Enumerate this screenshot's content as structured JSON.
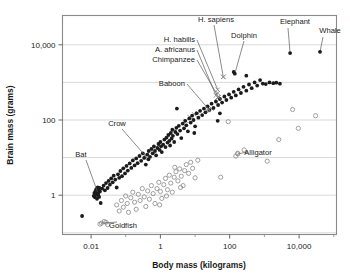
{
  "chart_data": {
    "type": "scatter",
    "title": "",
    "xlabel": "Body mass (kilograms)",
    "ylabel": "Brain mass (grams)",
    "xscale": "log",
    "yscale": "log",
    "xlim": [
      0.0015,
      120000
    ],
    "ylim": [
      0.09,
      60000
    ],
    "grid": true,
    "legend": "none",
    "xticks_labeled": [
      "0.01",
      "1",
      "100",
      "10,000"
    ],
    "xticks_values": [
      0.01,
      1,
      100,
      10000
    ],
    "xticks_minor_values": [
      0.1,
      10,
      1000,
      100000
    ],
    "yticks_labeled": [
      "1",
      "100",
      "10,000"
    ],
    "yticks_values": [
      1,
      100,
      10000
    ],
    "ygrid_values": [
      0.1,
      1,
      10,
      100,
      1000,
      10000
    ],
    "series": [
      {
        "name": "mammals-and-birds",
        "marker": "filled-circle",
        "color": "#1b1b1b",
        "points": [
          [
            0.0055,
            0.28
          ],
          [
            0.012,
            0.95
          ],
          [
            0.0125,
            1.15
          ],
          [
            0.013,
            0.88
          ],
          [
            0.0135,
            1.3
          ],
          [
            0.014,
            1.05
          ],
          [
            0.0142,
            1.45
          ],
          [
            0.0148,
            0.8
          ],
          [
            0.015,
            1.2
          ],
          [
            0.0155,
            1.6
          ],
          [
            0.016,
            1.0
          ],
          [
            0.0165,
            1.35
          ],
          [
            0.017,
            0.9
          ],
          [
            0.0175,
            1.55
          ],
          [
            0.018,
            1.25
          ],
          [
            0.019,
            0.62
          ],
          [
            0.021,
            1.5
          ],
          [
            0.023,
            1.8
          ],
          [
            0.025,
            1.35
          ],
          [
            0.027,
            2.1
          ],
          [
            0.03,
            1.55
          ],
          [
            0.032,
            2.4
          ],
          [
            0.035,
            1.9
          ],
          [
            0.038,
            2.8
          ],
          [
            0.042,
            2.2
          ],
          [
            0.045,
            3.3
          ],
          [
            0.05,
            2.6
          ],
          [
            0.055,
            1.6
          ],
          [
            0.06,
            3.6
          ],
          [
            0.065,
            2.9
          ],
          [
            0.07,
            4.4
          ],
          [
            0.078,
            3.2
          ],
          [
            0.085,
            5.2
          ],
          [
            0.095,
            3.8
          ],
          [
            0.105,
            6.0
          ],
          [
            0.115,
            4.5
          ],
          [
            0.13,
            7.0
          ],
          [
            0.145,
            5.3
          ],
          [
            0.16,
            8.4
          ],
          [
            0.18,
            6.2
          ],
          [
            0.2,
            9.5
          ],
          [
            0.22,
            7.1
          ],
          [
            0.25,
            11.0
          ],
          [
            0.28,
            8.2
          ],
          [
            0.31,
            13.0
          ],
          [
            0.34,
            9.8
          ],
          [
            0.38,
            6.5
          ],
          [
            0.42,
            12.0
          ],
          [
            0.46,
            15.0
          ],
          [
            0.5,
            10.5
          ],
          [
            0.55,
            17.0
          ],
          [
            0.6,
            13.0
          ],
          [
            0.65,
            20.0
          ],
          [
            0.7,
            15.0
          ],
          [
            0.75,
            11.5
          ],
          [
            0.82,
            18.0
          ],
          [
            0.88,
            23.0
          ],
          [
            0.95,
            16.0
          ],
          [
            1.0,
            26.0
          ],
          [
            1.05,
            20.0
          ],
          [
            1.1,
            14.0
          ],
          [
            1.2,
            22.0
          ],
          [
            1.3,
            30.0
          ],
          [
            1.4,
            19.0
          ],
          [
            1.5,
            34.0
          ],
          [
            1.6,
            25.0
          ],
          [
            1.7,
            40.0
          ],
          [
            1.8,
            28.0
          ],
          [
            1.9,
            21.0
          ],
          [
            2.0,
            45.0
          ],
          [
            2.1,
            32.0
          ],
          [
            2.2,
            55.0
          ],
          [
            2.3,
            38.0
          ],
          [
            2.5,
            26.0
          ],
          [
            2.7,
            48.0
          ],
          [
            2.9,
            62.0
          ],
          [
            3.1,
            42.0
          ],
          [
            3.4,
            70.0
          ],
          [
            3.7,
            52.0
          ],
          [
            4.0,
            33.0
          ],
          [
            4.4,
            80.0
          ],
          [
            4.8,
            60.0
          ],
          [
            5.2,
            95.0
          ],
          [
            5.6,
            72.0
          ],
          [
            6.2,
            50.0
          ],
          [
            6.8,
            110.0
          ],
          [
            7.5,
            85.0
          ],
          [
            8.2,
            130.0
          ],
          [
            9.0,
            100.0
          ],
          [
            10.0,
            68.0
          ],
          [
            11.0,
            150.0
          ],
          [
            12.5,
            115.0
          ],
          [
            14.0,
            175.0
          ],
          [
            16.0,
            135.0
          ],
          [
            18.0,
            200.0
          ],
          [
            20.0,
            160.0
          ],
          [
            23.0,
            230.0
          ],
          [
            26.0,
            185.0
          ],
          [
            30.0,
            270.0
          ],
          [
            34.0,
            210.0
          ],
          [
            40.0,
            310.0
          ],
          [
            46.0,
            250.0
          ],
          [
            52.0,
            360.0
          ],
          [
            60.0,
            290.0
          ],
          [
            70.0,
            420.0
          ],
          [
            80.0,
            340.0
          ],
          [
            95.0,
            480.0
          ],
          [
            110.0,
            390.0
          ],
          [
            130.0,
            560.0
          ],
          [
            150.0,
            450.0
          ],
          [
            180.0,
            650.0
          ],
          [
            210.0,
            520.0
          ],
          [
            250.0,
            760.0
          ],
          [
            300.0,
            600.0
          ],
          [
            360.0,
            880.0
          ],
          [
            430.0,
            700.0
          ],
          [
            520.0,
            1000.0
          ],
          [
            620.0,
            820.0
          ],
          [
            750.0,
            1150.0
          ],
          [
            900.0,
            930.0
          ],
          [
            1100.0,
            900.0
          ],
          [
            1400.0,
            1000.0
          ],
          [
            1800.0,
            950.0
          ],
          [
            2200.0,
            980.0
          ],
          [
            2800.0,
            920.0
          ],
          [
            130.0,
            1900.0
          ],
          [
            300.0,
            1500.0
          ],
          [
            45.0,
            95.0
          ],
          [
            52.0,
            150.0
          ],
          [
            9.5,
            45.0
          ],
          [
            3.0,
            200.0
          ]
        ]
      },
      {
        "name": "fish-reptiles-amphibians",
        "marker": "open-circle",
        "color": "#8f8f8f",
        "points": [
          [
            0.018,
            0.17
          ],
          [
            0.024,
            0.2
          ],
          [
            0.027,
            0.19
          ],
          [
            0.03,
            0.165
          ],
          [
            0.055,
            0.55
          ],
          [
            0.065,
            0.38
          ],
          [
            0.075,
            0.72
          ],
          [
            0.085,
            0.48
          ],
          [
            0.1,
            0.95
          ],
          [
            0.11,
            0.6
          ],
          [
            0.12,
            0.35
          ],
          [
            0.14,
            0.85
          ],
          [
            0.16,
            1.2
          ],
          [
            0.18,
            0.65
          ],
          [
            0.2,
            0.42
          ],
          [
            0.23,
            1.05
          ],
          [
            0.26,
            0.72
          ],
          [
            0.3,
            1.5
          ],
          [
            0.34,
            0.9
          ],
          [
            0.38,
            0.5
          ],
          [
            0.43,
            1.3
          ],
          [
            0.48,
            0.78
          ],
          [
            0.55,
            1.8
          ],
          [
            0.62,
            1.1
          ],
          [
            0.7,
            0.6
          ],
          [
            0.8,
            1.5
          ],
          [
            0.9,
            2.2
          ],
          [
            1.0,
            1.25
          ],
          [
            1.1,
            0.82
          ],
          [
            1.25,
            1.9
          ],
          [
            1.4,
            2.8
          ],
          [
            1.6,
            1.4
          ],
          [
            1.8,
            3.4
          ],
          [
            2.0,
            2.1
          ],
          [
            2.2,
            1.2
          ],
          [
            2.5,
            3.0
          ],
          [
            2.8,
            4.2
          ],
          [
            3.2,
            2.4
          ],
          [
            3.6,
            5.0
          ],
          [
            4.0,
            3.2
          ],
          [
            4.5,
            1.8
          ],
          [
            5.0,
            4.5
          ],
          [
            5.6,
            6.5
          ],
          [
            6.5,
            3.8
          ],
          [
            7.5,
            7.5
          ],
          [
            8.5,
            5.2
          ],
          [
            10.0,
            2.9
          ],
          [
            12.0,
            8.5
          ],
          [
            55.0,
            3.0
          ],
          [
            90.0,
            90.0
          ],
          [
            150.0,
            11.0
          ],
          [
            170.0,
            13.0
          ],
          [
            260.0,
            16.0
          ],
          [
            1200.0,
            8.0
          ],
          [
            2600.0,
            30.0
          ],
          [
            6500.0,
            190.0
          ],
          [
            9500.0,
            60.0
          ],
          [
            30000.0,
            130.0
          ],
          [
            2.6,
            5.5
          ],
          [
            3.8,
            1.6
          ],
          [
            1.5,
            0.95
          ],
          [
            0.95,
            0.55
          ]
        ]
      },
      {
        "name": "primates-and-hominids",
        "marker": "x",
        "color": "#8f8f8f",
        "points": [
          [
            0.35,
            11.0
          ],
          [
            0.9,
            22.0
          ],
          [
            2.4,
            52.0
          ],
          [
            5.5,
            95.0
          ],
          [
            7.0,
            120.0
          ],
          [
            9.5,
            140.0
          ],
          [
            12.0,
            150.0
          ],
          [
            22.0,
            180.0
          ],
          [
            30.0,
            200.0
          ],
          [
            45.0,
            400.0
          ],
          [
            45.0,
            520.0
          ],
          [
            65.0,
            1400.0
          ],
          [
            0.6,
            16.0
          ],
          [
            1.8,
            38.0
          ]
        ]
      }
    ],
    "annotations": [
      {
        "label": "H. sapiens",
        "point": [
          65.0,
          1400.0
        ],
        "marker": "x"
      },
      {
        "label": "Dolphin",
        "point": [
          140.0,
          1700.0
        ],
        "marker": "filled-circle"
      },
      {
        "label": "H. habilis",
        "point": [
          45.0,
          640.0
        ],
        "marker": "x"
      },
      {
        "label": "A. africanus",
        "point": [
          40.0,
          450.0
        ],
        "marker": "x"
      },
      {
        "label": "Chimpanzee",
        "point": [
          48.0,
          400.0
        ],
        "marker": "x"
      },
      {
        "label": "Baboon",
        "point": [
          25.0,
          190.0
        ],
        "marker": "x"
      },
      {
        "label": "Elephant",
        "point": [
          5500.0,
          6000.0
        ],
        "marker": "filled-circle"
      },
      {
        "label": "Whale",
        "point": [
          40000.0,
          6500.0
        ],
        "marker": "filled-circle"
      },
      {
        "label": "Crow",
        "point": [
          0.45,
          9.0
        ],
        "marker": "filled-circle"
      },
      {
        "label": "Bat",
        "point": [
          0.016,
          1.1
        ],
        "marker": "filled-circle"
      },
      {
        "label": "Goldfish",
        "point": [
          0.02,
          0.18
        ],
        "marker": "open-circle"
      },
      {
        "label": "Alligator",
        "point": [
          170.0,
          12.5
        ],
        "marker": "open-circle"
      }
    ]
  }
}
